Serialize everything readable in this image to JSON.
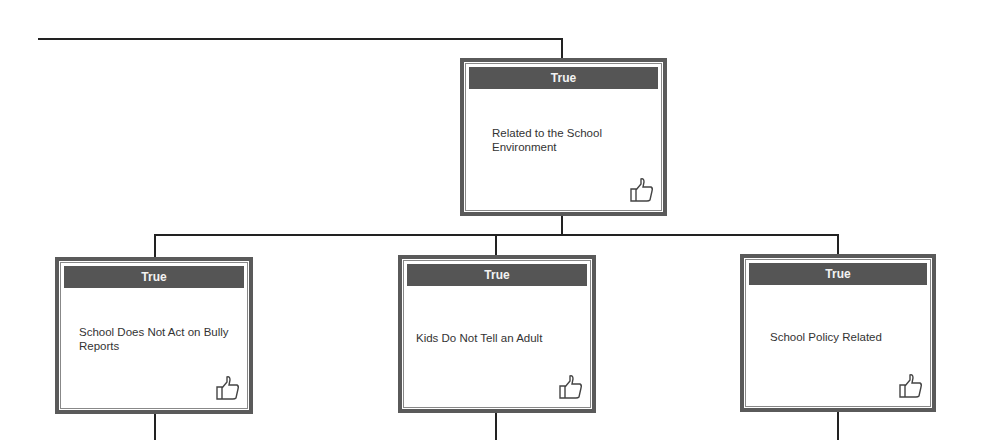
{
  "diagram": {
    "type": "decision-tree",
    "root": {
      "status": "True",
      "label": "Related to the School Environment",
      "icon": "thumbs-up-icon"
    },
    "children": [
      {
        "status": "True",
        "label": "School Does Not Act on Bully Reports",
        "icon": "thumbs-up-icon"
      },
      {
        "status": "True",
        "label": "Kids Do Not Tell an Adult",
        "icon": "thumbs-up-icon"
      },
      {
        "status": "True",
        "label": "School Policy Related",
        "icon": "thumbs-up-icon"
      }
    ]
  },
  "colors": {
    "header_bg": "#555555",
    "header_text": "#f2f2f2",
    "border": "#5a5a5a",
    "connector": "#222222",
    "label_text": "#333333"
  }
}
